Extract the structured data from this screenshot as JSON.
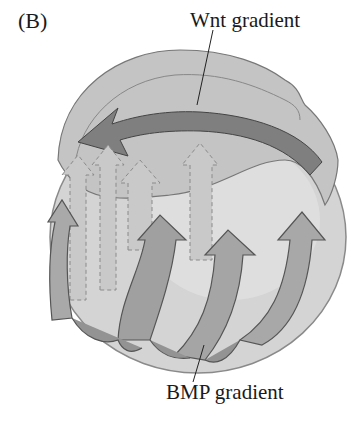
{
  "figure": {
    "panel_label": "(B)",
    "labels": {
      "wnt": "Wnt gradient",
      "bmp": "BMP gradient"
    },
    "colors": {
      "background": "#ffffff",
      "sphere": "#d2d2d2",
      "sphere_edge": "#8a8a8a",
      "dorsal_band": "#bdbdbd",
      "wnt_arrow": "#7d7d7d",
      "bmp_arrow": "#a8a8a8",
      "bmp_arrow_dark": "#949494",
      "dashed_arrow": "#c6c6c6",
      "stroke": "#555555",
      "text": "#1a1a1a"
    }
  }
}
